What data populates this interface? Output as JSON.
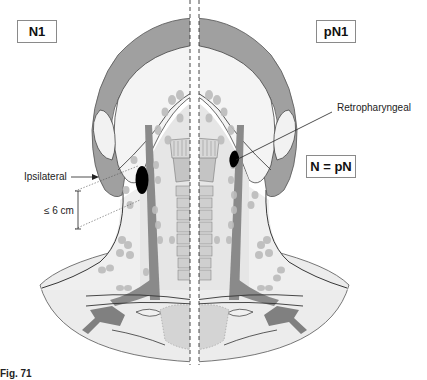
{
  "diagram": {
    "left_panel": {
      "label": "N1"
    },
    "right_panel": {
      "label": "pN1"
    },
    "equivalence_label": "N = pN",
    "annotations": {
      "ipsilateral": "Ipsilateral",
      "size_limit": "≤ 6 cm",
      "retropharyngeal": "Retropharyngeal"
    },
    "caption": "Fig. 71"
  },
  "colors": {
    "skin": "#f2f2f2",
    "hair": "#9a9a9a",
    "lymph_node": "#bdbdbd",
    "vessel": "#808080",
    "spine": "#c8c8c8",
    "metastasis": "#000000",
    "outline": "#333333"
  }
}
